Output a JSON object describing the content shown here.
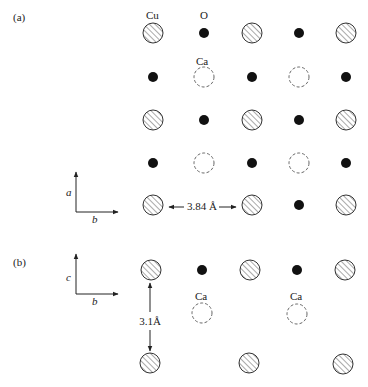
{
  "panel_a": {
    "label": "(a)",
    "column_labels": {
      "cu": "Cu",
      "o": "O",
      "ca": "Ca"
    },
    "axes": {
      "vertical": "a",
      "horizontal": "b"
    },
    "distance_label": "3.84 Å",
    "columns_x": [
      153,
      204,
      252,
      299,
      346
    ],
    "rows_y": [
      33,
      77,
      120,
      163,
      205
    ],
    "grid": [
      [
        "Cu",
        "O",
        "Cu",
        "O",
        "Cu"
      ],
      [
        "O",
        "Ca",
        "O",
        "Ca",
        "O"
      ],
      [
        "Cu",
        "O",
        "Cu",
        "O",
        "Cu"
      ],
      [
        "O",
        "Ca",
        "O",
        "Ca",
        "O"
      ],
      [
        "Cu",
        "",
        "Cu",
        "O",
        "Cu"
      ]
    ]
  },
  "panel_b": {
    "label": "(b)",
    "ca_label": "Ca",
    "axes": {
      "vertical": "c",
      "horizontal": "b"
    },
    "distance_label": "3.1Å",
    "atoms": [
      {
        "type": "Cu",
        "x": 151,
        "y": 270
      },
      {
        "type": "O",
        "x": 202,
        "y": 270
      },
      {
        "type": "Cu",
        "x": 250,
        "y": 270
      },
      {
        "type": "O",
        "x": 297,
        "y": 270
      },
      {
        "type": "Cu",
        "x": 345,
        "y": 270
      },
      {
        "type": "Ca",
        "x": 202,
        "y": 313
      },
      {
        "type": "Ca",
        "x": 297,
        "y": 314
      },
      {
        "type": "Cu",
        "x": 150,
        "y": 363
      },
      {
        "type": "Cu",
        "x": 249,
        "y": 363
      },
      {
        "type": "Cu",
        "x": 343,
        "y": 364
      }
    ]
  },
  "legend_colors": {
    "ink": "#222222",
    "hatch": "#555555",
    "dash": "#666666"
  }
}
